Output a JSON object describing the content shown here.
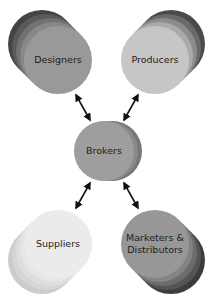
{
  "diagram": {
    "nodes": [
      {
        "id": "designers",
        "label": "Designers"
      },
      {
        "id": "producers",
        "label": "Producers"
      },
      {
        "id": "brokers",
        "label": "Brokers"
      },
      {
        "id": "suppliers",
        "label": "Suppliers"
      },
      {
        "id": "marketers",
        "label": "Marketers & Distributors",
        "line1": "Marketers &",
        "line2": "Distributors"
      }
    ],
    "edges": [
      {
        "from": "designers",
        "to": "brokers",
        "type": "bidirectional"
      },
      {
        "from": "producers",
        "to": "brokers",
        "type": "bidirectional"
      },
      {
        "from": "suppliers",
        "to": "brokers",
        "type": "bidirectional"
      },
      {
        "from": "marketers",
        "to": "brokers",
        "type": "bidirectional"
      }
    ],
    "colors": {
      "designers": [
        "#444444",
        "#5c5c5c",
        "#747474",
        "#8a8a8a",
        "#9a9a9a"
      ],
      "producers": [
        "#4a4a4a",
        "#6a6a6a",
        "#8c8c8c",
        "#aaaaaa",
        "#c4c4c4"
      ],
      "brokers": [
        "#7a7a7a",
        "#8c8c8c",
        "#a0a0a0"
      ],
      "suppliers": [
        "#cfcfcf",
        "#d8d8d8",
        "#e0e0e0",
        "#e8e8e8",
        "#ececec"
      ],
      "marketers": [
        "#3e3e3e",
        "#555555",
        "#6c6c6c",
        "#828282",
        "#969696"
      ],
      "arrow": "#111111"
    }
  }
}
